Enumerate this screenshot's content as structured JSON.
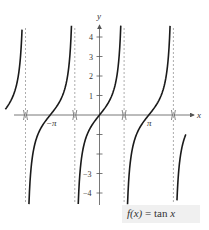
{
  "chart_data": {
    "type": "line",
    "title": "",
    "function_label": "f(x) = tan x",
    "xlabel": "x",
    "ylabel": "y",
    "xlim": [
      -6.4,
      6.0
    ],
    "ylim": [
      -4.4,
      4.5
    ],
    "grid": false,
    "legend_position": "bottom-right",
    "x_tick_labels": [
      {
        "value": -3.14159,
        "label": "−π"
      },
      {
        "value": 3.14159,
        "label": "π"
      }
    ],
    "y_ticks": [
      -4,
      -3,
      -2,
      -1,
      1,
      2,
      3,
      4
    ],
    "y_tick_labels": [
      {
        "value": 4,
        "label": "4"
      },
      {
        "value": 3,
        "label": "3"
      },
      {
        "value": 2,
        "label": "2"
      },
      {
        "value": 1,
        "label": "1"
      },
      {
        "value": -3,
        "label": "−3"
      },
      {
        "value": -4,
        "label": "−4"
      }
    ],
    "asymptotes": [
      -4.71239,
      -1.5708,
      1.5708,
      4.71239
    ],
    "asymptote_style": "dashed",
    "series": [
      {
        "name": "tan x",
        "branch_domain": [
          -6.0,
          -4.937
        ],
        "note": "partial branch left of x = -3π/2"
      },
      {
        "name": "tan x",
        "branch_domain": [
          -4.497,
          -1.786
        ],
        "zero_at": -3.14159
      },
      {
        "name": "tan x",
        "branch_domain": [
          -1.355,
          1.356
        ],
        "zero_at": 0
      },
      {
        "name": "tan x",
        "branch_domain": [
          1.786,
          4.497
        ],
        "zero_at": 3.14159
      },
      {
        "name": "tan x",
        "branch_domain": [
          4.937,
          5.5
        ],
        "note": "partial branch right of x = 3π/2"
      }
    ],
    "colors": {
      "curve": "#1a1a1a",
      "axis": "#555555",
      "asymptote": "#8a8a8a",
      "label_box": "#f0f0f0"
    }
  },
  "labels": {
    "x_axis": "x",
    "y_axis": "y",
    "neg_pi": "−π",
    "pi": "π",
    "y4": "4",
    "y3": "3",
    "y2": "2",
    "y1": "1",
    "ym3": "−3",
    "ym4": "−4",
    "fn_name": "f(x)",
    "fn_eq": " = tan ",
    "fn_var": "x"
  }
}
